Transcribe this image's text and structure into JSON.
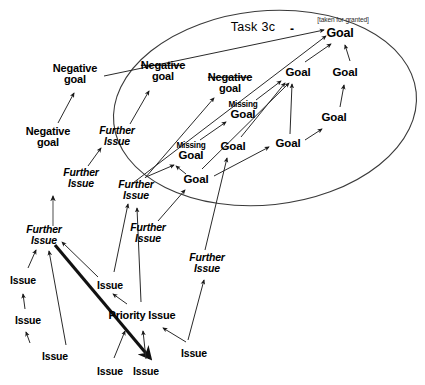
{
  "diagram": {
    "title_label": "Task 3c",
    "annotation_label": "[taken for granted]",
    "negative_sign": "-",
    "boundary_shape": "ellipse",
    "stroke_color": "#1a1a1a",
    "background_color": "#ffffff",
    "text_color": "#000000"
  },
  "nodes": [
    {
      "id": "n1",
      "label": "Negative goal",
      "line1": "Negative",
      "line2": "goal",
      "type": "negative-goal",
      "struck": false,
      "x": 75,
      "y": 74
    },
    {
      "id": "n2",
      "label": "Negative goal",
      "line1": "Negative",
      "line2": "goal",
      "type": "negative-goal",
      "struck": false,
      "x": 48,
      "y": 137
    },
    {
      "id": "n3",
      "label": "Negative goal",
      "line1": "Negative",
      "line2": "goal",
      "type": "negative-goal",
      "struck": true,
      "x": 163,
      "y": 71
    },
    {
      "id": "n4",
      "label": "Negative goal",
      "line1": "Negative",
      "line2": "goal",
      "type": "negative-goal",
      "struck": true,
      "x": 230,
      "y": 83
    },
    {
      "id": "n5",
      "label": "Further Issue",
      "line1": "Further",
      "line2": "Issue",
      "type": "further-issue",
      "struck": false,
      "x": 117,
      "y": 136
    },
    {
      "id": "n6",
      "label": "Further Issue",
      "line1": "Further",
      "line2": "Issue",
      "type": "further-issue",
      "struck": false,
      "x": 81,
      "y": 178
    },
    {
      "id": "n7",
      "label": "Further Issue",
      "line1": "Further",
      "line2": "Issue",
      "type": "further-issue",
      "struck": false,
      "x": 136,
      "y": 190
    },
    {
      "id": "n8",
      "label": "Further Issue",
      "line1": "Further",
      "line2": "Issue",
      "type": "further-issue",
      "struck": false,
      "x": 148,
      "y": 233
    },
    {
      "id": "n9",
      "label": "Further Issue",
      "line1": "Further",
      "line2": "Issue",
      "type": "further-issue",
      "struck": false,
      "x": 207,
      "y": 263
    },
    {
      "id": "n10",
      "label": "Further Issue",
      "line1": "Further",
      "line2": "Issue",
      "type": "further-issue",
      "struck": false,
      "x": 44,
      "y": 235
    },
    {
      "id": "n11",
      "label": "Issue",
      "line1": "Issue",
      "line2": "",
      "type": "issue",
      "struck": false,
      "x": 23,
      "y": 280
    },
    {
      "id": "n12",
      "label": "Issue",
      "line1": "Issue",
      "line2": "",
      "type": "issue",
      "struck": false,
      "x": 28,
      "y": 320
    },
    {
      "id": "n13",
      "label": "Issue",
      "line1": "Issue",
      "line2": "",
      "type": "issue",
      "struck": false,
      "x": 55,
      "y": 356
    },
    {
      "id": "n14",
      "label": "Issue",
      "line1": "Issue",
      "line2": "",
      "type": "issue",
      "struck": false,
      "x": 110,
      "y": 285
    },
    {
      "id": "n15",
      "label": "Priority Issue",
      "line1": "Priority Issue",
      "line2": "",
      "type": "priority-issue",
      "struck": false,
      "x": 142,
      "y": 316
    },
    {
      "id": "n16",
      "label": "Issue",
      "line1": "Issue",
      "line2": "",
      "type": "issue",
      "struck": false,
      "x": 110,
      "y": 371
    },
    {
      "id": "n17",
      "label": "Issue",
      "line1": "Issue",
      "line2": "",
      "type": "issue",
      "struck": false,
      "x": 146,
      "y": 371
    },
    {
      "id": "n18",
      "label": "Issue",
      "line1": "Issue",
      "line2": "",
      "type": "issue",
      "struck": false,
      "x": 194,
      "y": 353
    },
    {
      "id": "n19",
      "label": "Missing Goal",
      "line1": "Missing",
      "line2": "Goal",
      "type": "missing-goal",
      "struck": false,
      "x": 191,
      "y": 152
    },
    {
      "id": "n20",
      "label": "Missing Goal",
      "line1": "Missing",
      "line2": "Goal",
      "type": "missing-goal",
      "struck": false,
      "x": 243,
      "y": 111
    },
    {
      "id": "n21",
      "label": "Goal",
      "line1": "Goal",
      "line2": "",
      "type": "goal",
      "struck": false,
      "x": 196,
      "y": 180
    },
    {
      "id": "n22",
      "label": "Goal",
      "line1": "Goal",
      "line2": "",
      "type": "goal",
      "struck": false,
      "x": 233,
      "y": 147
    },
    {
      "id": "n23",
      "label": "Goal",
      "line1": "Goal",
      "line2": "",
      "type": "goal",
      "struck": false,
      "x": 288,
      "y": 144
    },
    {
      "id": "n24",
      "label": "Goal",
      "line1": "Goal",
      "line2": "",
      "type": "goal",
      "struck": false,
      "x": 298,
      "y": 73
    },
    {
      "id": "n25",
      "label": "Goal",
      "line1": "Goal",
      "line2": "",
      "type": "goal",
      "struck": false,
      "x": 345,
      "y": 73
    },
    {
      "id": "n26",
      "label": "Goal",
      "line1": "Goal",
      "line2": "",
      "type": "goal",
      "struck": false,
      "x": 334,
      "y": 118
    },
    {
      "id": "n27",
      "label": "Goal",
      "line1": "Goal",
      "line2": "",
      "type": "goal",
      "struck": false,
      "x": 340,
      "y": 33
    }
  ],
  "edges": [
    {
      "from": "n2",
      "to": "n1",
      "style": "thin"
    },
    {
      "from": "n6",
      "to": "n5",
      "style": "thin"
    },
    {
      "from": "n5",
      "to": "n3",
      "style": "thin"
    },
    {
      "from": "n10",
      "to": "n6",
      "style": "thin"
    },
    {
      "from": "n11",
      "to": "n10",
      "style": "thin"
    },
    {
      "from": "n12",
      "to": "n11",
      "style": "thin"
    },
    {
      "from": "n13",
      "to": "n12",
      "style": "thin"
    },
    {
      "from": "n13",
      "to": "n10",
      "style": "thin"
    },
    {
      "from": "n14",
      "to": "n10",
      "style": "thin"
    },
    {
      "from": "n10",
      "to": "n17",
      "style": "thick"
    },
    {
      "from": "n15",
      "to": "n14",
      "style": "thin"
    },
    {
      "from": "n16",
      "to": "n15",
      "style": "thin"
    },
    {
      "from": "n17",
      "to": "n15",
      "style": "thin"
    },
    {
      "from": "n18",
      "to": "n15",
      "style": "thin"
    },
    {
      "from": "n15",
      "to": "n7",
      "style": "thin"
    },
    {
      "from": "n18",
      "to": "n9",
      "style": "thin"
    },
    {
      "from": "n7",
      "to": "n4",
      "style": "thin"
    },
    {
      "from": "n8",
      "to": "n21",
      "style": "thin"
    },
    {
      "from": "n9",
      "to": "n22",
      "style": "thin"
    },
    {
      "from": "n21",
      "to": "n19",
      "style": "thin"
    },
    {
      "from": "n19",
      "to": "n20",
      "style": "thin"
    },
    {
      "from": "n20",
      "to": "n24",
      "style": "thin"
    },
    {
      "from": "n22",
      "to": "n24",
      "style": "thin"
    },
    {
      "from": "n23",
      "to": "n24",
      "style": "thin"
    },
    {
      "from": "n21",
      "to": "n23",
      "style": "thin"
    },
    {
      "from": "n23",
      "to": "n26",
      "style": "thin"
    },
    {
      "from": "n26",
      "to": "n25",
      "style": "thin"
    },
    {
      "from": "n24",
      "to": "n27",
      "style": "thin"
    },
    {
      "from": "n25",
      "to": "n27",
      "style": "thin"
    },
    {
      "from": "n5",
      "to": "n27",
      "style": "long"
    },
    {
      "from": "n7",
      "to": "n27",
      "style": "long"
    }
  ]
}
